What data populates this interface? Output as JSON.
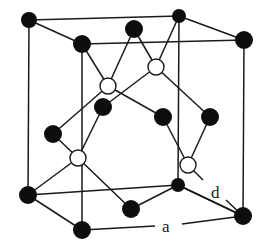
{
  "figure": {
    "labels": {
      "bond_length": "d",
      "lattice_constant": "a"
    },
    "colors": {
      "line": "#1a1a1a",
      "atom_black": "#0d0d0d",
      "atom_white": "#ffffff",
      "background": "#ffffff"
    },
    "cube_vertices": {
      "top_back_left": [
        29,
        20
      ],
      "top_back_right": [
        179,
        16
      ],
      "top_front_left": [
        82,
        44
      ],
      "top_front_right": [
        244,
        40
      ],
      "bottom_back_left": [
        28,
        195
      ],
      "bottom_back_right": [
        178,
        185
      ],
      "bottom_front_left": [
        82,
        230
      ],
      "bottom_front_right": [
        243,
        216
      ]
    },
    "black_atoms": [
      {
        "id": "top_back_left",
        "pos": [
          29,
          20
        ],
        "r": 8
      },
      {
        "id": "top_back_right",
        "pos": [
          179,
          16
        ],
        "r": 7
      },
      {
        "id": "top_front_left",
        "pos": [
          82,
          44
        ],
        "r": 9
      },
      {
        "id": "top_front_right",
        "pos": [
          244,
          40
        ],
        "r": 9
      },
      {
        "id": "top_face_center",
        "pos": [
          134,
          29
        ],
        "r": 9
      },
      {
        "id": "left_face_center",
        "pos": [
          53,
          134
        ],
        "r": 9
      },
      {
        "id": "back_face_center",
        "pos": [
          103,
          107
        ],
        "r": 9
      },
      {
        "id": "front_face_center",
        "pos": [
          163,
          117
        ],
        "r": 9
      },
      {
        "id": "right_face_center",
        "pos": [
          210,
          117
        ],
        "r": 9
      },
      {
        "id": "bottom_back_left",
        "pos": [
          28,
          195
        ],
        "r": 9
      },
      {
        "id": "bottom_back_right",
        "pos": [
          178,
          185
        ],
        "r": 7
      },
      {
        "id": "bottom_front_left",
        "pos": [
          82,
          230
        ],
        "r": 9
      },
      {
        "id": "bottom_front_right",
        "pos": [
          243,
          216
        ],
        "r": 9
      },
      {
        "id": "bottom_face_center",
        "pos": [
          131,
          209
        ],
        "r": 9
      }
    ],
    "white_atoms": [
      {
        "id": "interior_1",
        "pos": [
          108,
          86
        ],
        "r": 8
      },
      {
        "id": "interior_2",
        "pos": [
          156,
          67
        ],
        "r": 8
      },
      {
        "id": "interior_3",
        "pos": [
          78,
          158
        ],
        "r": 8
      },
      {
        "id": "interior_4",
        "pos": [
          188,
          165
        ],
        "r": 8
      }
    ]
  }
}
